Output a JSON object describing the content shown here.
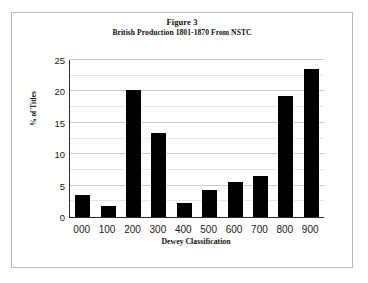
{
  "figure": {
    "frame_border_color": "#b9b9b9",
    "background": "#ffffff"
  },
  "chart_data": {
    "type": "bar",
    "title": "Figure 3",
    "subtitle": "British Production 1801-1870 From NSTC",
    "xlabel": "Dewey Classification",
    "ylabel": "% of Titles",
    "categories": [
      "000",
      "100",
      "200",
      "300",
      "400",
      "500",
      "600",
      "700",
      "800",
      "900"
    ],
    "values": [
      3.5,
      1.7,
      20.3,
      13.4,
      2.2,
      4.3,
      5.6,
      6.6,
      19.2,
      23.5
    ],
    "ylim": [
      0,
      25
    ],
    "ytick_labels": [
      "0",
      "5",
      "10",
      "15",
      "20",
      "25"
    ],
    "ytick_values": [
      0,
      5,
      10,
      15,
      20,
      25
    ],
    "minor_gridline_values": [
      2.5,
      7.5,
      12.5,
      17.5,
      22.5
    ],
    "grid": true,
    "legend": "none",
    "bar_color": "#000000",
    "gridline_color": "#c9c9c9",
    "axis_color": "#2b2b2b"
  }
}
